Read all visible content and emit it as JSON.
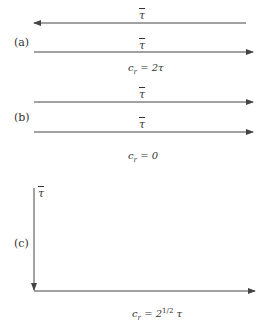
{
  "diagram": {
    "panels": [
      {
        "label": "(a)",
        "vectors": [
          {
            "symbol": "τ",
            "direction": "left"
          },
          {
            "symbol": "τ",
            "direction": "right"
          }
        ],
        "result": {
          "lhs": "c",
          "sub": "r",
          "rhs": " = 2τ"
        }
      },
      {
        "label": "(b)",
        "vectors": [
          {
            "symbol": "τ",
            "direction": "right"
          },
          {
            "symbol": "τ",
            "direction": "right"
          }
        ],
        "result": {
          "lhs": "c",
          "sub": "r",
          "rhs": " = 0"
        }
      },
      {
        "label": "(c)",
        "vectors": [
          {
            "symbol": "τ",
            "direction": "down"
          },
          {
            "symbol": "τ",
            "direction": "right"
          }
        ],
        "result": {
          "lhs": "c",
          "sub": "r",
          "eq": " = 2",
          "sup": "1/2",
          "tail": " τ"
        }
      }
    ],
    "colors": {
      "line": "#444444",
      "text": "#333333"
    }
  }
}
